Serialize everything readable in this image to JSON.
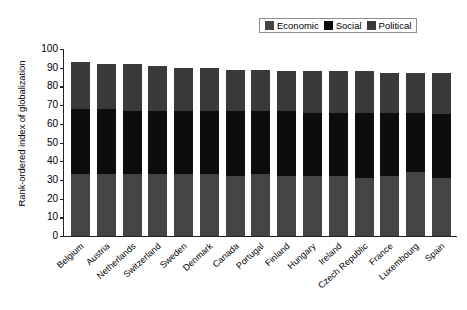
{
  "chart_data": {
    "type": "bar",
    "stacked": true,
    "title": "",
    "xlabel": "",
    "ylabel": "Rank-ordered index of globalization",
    "ylim": [
      0,
      100
    ],
    "yticks": [
      0,
      10,
      20,
      30,
      40,
      50,
      60,
      70,
      80,
      90,
      100
    ],
    "grid": false,
    "legend_position": "top-right",
    "categories": [
      "Belgium",
      "Austria",
      "Netherlands",
      "Switzerland",
      "Sweden",
      "Denmark",
      "Canada",
      "Portugal",
      "Finland",
      "Hungary",
      "Ireland",
      "Czech Republic",
      "France",
      "Luxembourg",
      "Spain"
    ],
    "series": [
      {
        "name": "Economic",
        "color": "#444444",
        "values": [
          33,
          33,
          33,
          33,
          33,
          33,
          32,
          33,
          32,
          32,
          32,
          31,
          32,
          34,
          31
        ]
      },
      {
        "name": "Social",
        "color": "#0d0d0d",
        "values": [
          35,
          35,
          34,
          34,
          34,
          34,
          35,
          34,
          35,
          34,
          34,
          35,
          34,
          32,
          34
        ]
      },
      {
        "name": "Political",
        "color": "#3a3a3a",
        "values": [
          25,
          24,
          25,
          24,
          23,
          23,
          22,
          22,
          21,
          22,
          22,
          22,
          21,
          21,
          22
        ]
      }
    ],
    "totals": [
      93,
      92,
      92,
      91,
      90,
      90,
      89,
      89,
      88,
      88,
      88,
      88,
      87,
      87,
      87
    ]
  },
  "legend": {
    "items": [
      {
        "label": "Economic",
        "swatch": "legend-swatch-economic"
      },
      {
        "label": "Social",
        "swatch": "legend-swatch-social"
      },
      {
        "label": "Political",
        "swatch": "legend-swatch-political"
      }
    ]
  }
}
